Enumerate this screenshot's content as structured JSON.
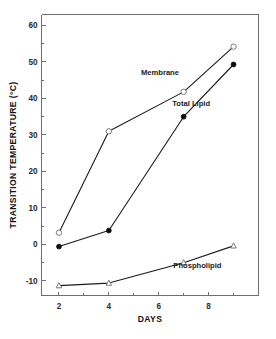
{
  "chart_data": {
    "type": "line",
    "title": "",
    "xlabel": "DAYS",
    "ylabel": "TRANSITION TEMPERATURE (°C)",
    "xlim": [
      1.3,
      10.0
    ],
    "ylim": [
      -14,
      63
    ],
    "grid": false,
    "legend": "inline-annotations",
    "xticks": [
      2,
      4,
      6,
      8
    ],
    "xtick_labels": [
      "2",
      "4",
      "6",
      "8"
    ],
    "xminor_ticks": [
      3,
      5,
      7,
      9
    ],
    "yticks": [
      -10,
      0,
      10,
      20,
      30,
      40,
      50,
      60
    ],
    "ytick_labels": [
      "-10",
      "0",
      "10",
      "20",
      "30",
      "40",
      "50",
      "60"
    ],
    "series": [
      {
        "name": "Membrane",
        "marker": "open-circle",
        "x": [
          2,
          4,
          7,
          9
        ],
        "values": [
          3.2,
          31.0,
          41.8,
          54.2
        ]
      },
      {
        "name": "Total Lipid",
        "marker": "filled-circle",
        "x": [
          2,
          4,
          7,
          9
        ],
        "values": [
          -0.6,
          3.8,
          35.0,
          49.3
        ]
      },
      {
        "name": "Phospholipid",
        "marker": "open-triangle",
        "x": [
          2,
          4,
          7,
          9
        ],
        "values": [
          -11.3,
          -10.6,
          -5.0,
          -0.4
        ]
      }
    ],
    "annotations": [
      {
        "text": "Membrane",
        "x": 6.05,
        "y": 46.5
      },
      {
        "text": "Total Lipid",
        "x": 7.3,
        "y": 38.0
      },
      {
        "text": "Phospholipid",
        "x": 7.55,
        "y": -6.6
      }
    ]
  },
  "axes": {
    "x_title": "DAYS",
    "y_title": "TRANSITION TEMPERATURE (°C)"
  },
  "colors": {
    "line": "#1a1a1a",
    "axis": "#6e6e6e",
    "text": "#111111",
    "background": "#ffffff"
  }
}
